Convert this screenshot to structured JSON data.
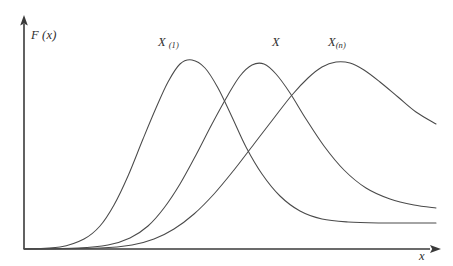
{
  "figure": {
    "background_color": "#ffffff",
    "line_color": "#4a4a4a",
    "axis_color": "#3a3a3a",
    "axis": {
      "y_label": "F",
      "y_label_arg": "(x)",
      "x_label": "x",
      "origin_x": 24,
      "origin_y": 249,
      "y_top": 18,
      "x_right": 441,
      "ticks": [],
      "gridlines": false
    },
    "labels": {
      "curve_1": {
        "base": "X",
        "subscript": "(1)"
      },
      "curve_2": {
        "base": "X",
        "subscript": ""
      },
      "curve_3": {
        "base": "X",
        "subscript": "(n)"
      }
    }
  },
  "chart_data": {
    "type": "line",
    "title": "",
    "subtitle": "",
    "xlabel": "x",
    "ylabel": "F (x)",
    "xlim": [
      0,
      1
    ],
    "ylim": [
      0,
      1
    ],
    "grid": false,
    "legend": "inline-curve-labels",
    "axis_style": "arrow-headed half axes, no tick marks",
    "annotations": [
      {
        "text": "X (1)",
        "x": 0.325,
        "y": 0.96,
        "target_series": "X_(1)"
      },
      {
        "text": "X",
        "x": 0.6,
        "y": 0.96,
        "target_series": "X"
      },
      {
        "text": "X (n)",
        "x": 0.73,
        "y": 0.96,
        "target_series": "X_(n)"
      }
    ],
    "series": [
      {
        "name": "X_(1)",
        "description": "density of the sample minimum; earliest, tallest-rising peak with long low right tail",
        "peak_x": 0.375,
        "peak_y": 0.82,
        "points_px": [
          [
            24,
            249
          ],
          [
            60,
            247
          ],
          [
            84,
            239
          ],
          [
            100,
            226
          ],
          [
            114,
            205
          ],
          [
            128,
            176
          ],
          [
            143,
            139
          ],
          [
            156,
            108
          ],
          [
            168,
            82
          ],
          [
            180,
            64
          ],
          [
            192,
            60
          ],
          [
            205,
            68
          ],
          [
            218,
            88
          ],
          [
            232,
            117
          ],
          [
            246,
            147
          ],
          [
            262,
            174
          ],
          [
            280,
            196
          ],
          [
            300,
            211
          ],
          [
            322,
            219
          ],
          [
            348,
            222
          ],
          [
            380,
            223
          ],
          [
            412,
            223
          ],
          [
            436,
            223
          ]
        ]
      },
      {
        "name": "X",
        "description": "density of the underlying variable; middle peak, moderate right tail",
        "peak_x": 0.52,
        "peak_y": 0.8,
        "points_px": [
          [
            24,
            249
          ],
          [
            78,
            248
          ],
          [
            108,
            245
          ],
          [
            130,
            238
          ],
          [
            148,
            226
          ],
          [
            164,
            208
          ],
          [
            180,
            184
          ],
          [
            196,
            155
          ],
          [
            212,
            124
          ],
          [
            228,
            95
          ],
          [
            240,
            76
          ],
          [
            252,
            65
          ],
          [
            264,
            64
          ],
          [
            276,
            74
          ],
          [
            290,
            93
          ],
          [
            306,
            119
          ],
          [
            324,
            146
          ],
          [
            344,
            170
          ],
          [
            366,
            188
          ],
          [
            390,
            199
          ],
          [
            414,
            205
          ],
          [
            436,
            208
          ]
        ]
      },
      {
        "name": "X_(n)",
        "description": "density of the sample maximum; latest peak, highest right tail",
        "peak_x": 0.72,
        "peak_y": 0.83,
        "points_px": [
          [
            24,
            249
          ],
          [
            100,
            248
          ],
          [
            132,
            245
          ],
          [
            154,
            239
          ],
          [
            174,
            229
          ],
          [
            194,
            214
          ],
          [
            214,
            194
          ],
          [
            234,
            170
          ],
          [
            254,
            144
          ],
          [
            274,
            118
          ],
          [
            292,
            95
          ],
          [
            308,
            78
          ],
          [
            322,
            67
          ],
          [
            336,
            62
          ],
          [
            350,
            63
          ],
          [
            364,
            70
          ],
          [
            380,
            82
          ],
          [
            398,
            97
          ],
          [
            416,
            112
          ],
          [
            436,
            124
          ]
        ]
      }
    ]
  }
}
